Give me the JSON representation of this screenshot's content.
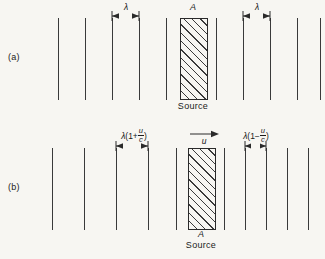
{
  "figure": {
    "background_color": "#f7f6f2",
    "line_color": "#3a3a3a"
  },
  "panel_a": {
    "label": "(a)",
    "source_caption": "Source",
    "source_marker": "A",
    "lambda_left": "λ",
    "lambda_right": "λ",
    "description": "Stationary source: wavefronts equally spaced on both sides",
    "wavefronts_left_x": [
      58,
      85,
      112,
      139,
      166
    ],
    "wavefronts_right_x": [
      216,
      243,
      270,
      297,
      320
    ],
    "wavefront_top": 18,
    "wavefront_bottom": 100,
    "source_x": 180,
    "source_width": 28,
    "source_top": 18,
    "source_height": 82,
    "dim_left": {
      "x1": 112,
      "x2": 139,
      "y": 16
    },
    "dim_right": {
      "x1": 243,
      "x2": 270,
      "y": 16
    }
  },
  "panel_b": {
    "label": "(b)",
    "source_caption": "Source",
    "source_marker": "A",
    "velocity_label": "u",
    "lambda_left_prefix": "λ",
    "lambda_left_open": "(1+",
    "lambda_left_num": "u",
    "lambda_left_den": "c",
    "lambda_left_close": ")",
    "lambda_right_prefix": "λ",
    "lambda_right_open": "(1−",
    "lambda_right_num": "u",
    "lambda_right_den": "c",
    "lambda_right_close": ")",
    "description": "Moving source: wavefronts stretched behind, compressed ahead",
    "wavefronts_left_x": [
      52,
      84,
      116,
      148,
      176
    ],
    "wavefronts_right_x": [
      224,
      245,
      266,
      287,
      308
    ],
    "wavefront_top": 148,
    "wavefront_bottom": 230,
    "source_x": 188,
    "source_width": 28,
    "source_top": 148,
    "source_height": 82,
    "dim_left": {
      "x1": 116,
      "x2": 148,
      "y": 146
    },
    "dim_right": {
      "x1": 245,
      "x2": 266,
      "y": 146
    },
    "velocity_arrow": {
      "x1": 192,
      "x2": 218,
      "y": 134
    }
  }
}
